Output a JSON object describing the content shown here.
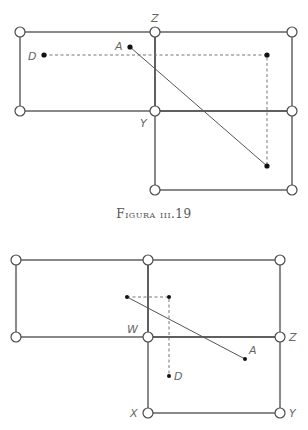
{
  "caption": "Figura iii.19",
  "figure1": {
    "labels": {
      "Z": "Z",
      "Y": "Y",
      "A": "A",
      "D": "D"
    },
    "joints": [
      [
        20,
        32
      ],
      [
        155,
        32
      ],
      [
        292,
        32
      ],
      [
        20,
        111
      ],
      [
        155,
        111
      ],
      [
        292,
        111
      ],
      [
        155,
        190
      ],
      [
        292,
        190
      ]
    ],
    "points": {
      "D": [
        44,
        55
      ],
      "A": [
        130,
        47
      ],
      "corner": [
        267,
        55
      ],
      "end": [
        267,
        166
      ]
    }
  },
  "figure2": {
    "labels": {
      "W": "W",
      "Z": "Z",
      "A": "A",
      "D": "D",
      "X": "X",
      "Y": "Y"
    },
    "joints": [
      [
        16,
        260
      ],
      [
        148,
        260
      ],
      [
        280,
        260
      ],
      [
        16,
        337
      ],
      [
        148,
        337
      ],
      [
        280,
        337
      ],
      [
        148,
        413
      ],
      [
        280,
        413
      ]
    ],
    "points": {
      "start": [
        127,
        297
      ],
      "corner": [
        169,
        297
      ],
      "D": [
        169,
        376
      ],
      "A": [
        245,
        359
      ]
    }
  }
}
